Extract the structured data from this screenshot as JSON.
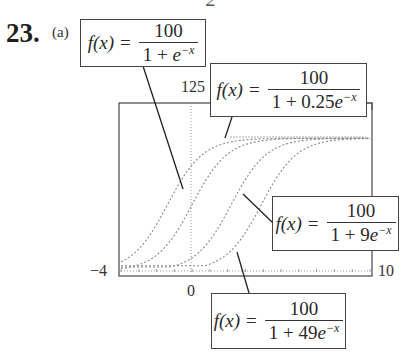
{
  "problem": {
    "number": "23.",
    "part": "(a)",
    "stray_glyph": "2"
  },
  "labels": [
    {
      "id": "f1",
      "fx": "f(x)",
      "eq": "=",
      "numerator": "100",
      "den_prefix": "1 + ",
      "den_e": "e",
      "den_exp": "−x"
    },
    {
      "id": "f2",
      "fx": "f(x)",
      "eq": "=",
      "numerator": "100",
      "den_prefix": "1 + 0.25",
      "den_e": "e",
      "den_exp": "−x"
    },
    {
      "id": "f3",
      "fx": "f(x)",
      "eq": "=",
      "numerator": "100",
      "den_prefix": "1 + 9",
      "den_e": "e",
      "den_exp": "−x"
    },
    {
      "id": "f4",
      "fx": "f(x)",
      "eq": "=",
      "numerator": "100",
      "den_prefix": "1 + 49",
      "den_e": "e",
      "den_exp": "−x"
    }
  ],
  "axes": {
    "ymax_label": "125",
    "xmin_label": "−4",
    "xmax_label": "10",
    "origin_label": "0"
  },
  "colors": {
    "curve": "#8a8a8a",
    "frame": "#555555",
    "text": "#222222"
  },
  "chart_data": {
    "type": "line",
    "title": "",
    "xlabel": "",
    "ylabel": "",
    "xlim": [
      -4,
      10
    ],
    "ylim": [
      0,
      125
    ],
    "tick_labels": {
      "x": [
        "−4",
        "0",
        "10"
      ],
      "y": [
        "125"
      ]
    },
    "grid": false,
    "legend": "callout boxes",
    "series": [
      {
        "name": "f(x) = 100/(1 + 0.25e^(−x))",
        "a": 0.25
      },
      {
        "name": "f(x) = 100/(1 + e^(−x))",
        "a": 1
      },
      {
        "name": "f(x) = 100/(1 + 9e^(−x))",
        "a": 9
      },
      {
        "name": "f(x) = 100/(1 + 49e^(−x))",
        "a": 49
      }
    ],
    "x": [
      -4,
      -3,
      -2,
      -1,
      0,
      1,
      2,
      3,
      4,
      5,
      6,
      7,
      8,
      9,
      10
    ],
    "values_by_series": {
      "a=0.25": [
        17.9,
        33.4,
        57.5,
        78.6,
        80.0,
        91.6,
        96.7,
        98.8,
        99.5,
        99.8,
        99.9,
        100,
        100,
        100,
        100
      ],
      "a=1": [
        1.8,
        4.7,
        11.9,
        26.9,
        50.0,
        73.1,
        88.1,
        95.3,
        98.2,
        99.3,
        99.8,
        99.9,
        100,
        100,
        100
      ],
      "a=9": [
        0.2,
        0.6,
        1.5,
        3.9,
        10.0,
        23.2,
        45.1,
        69.1,
        85.8,
        94.3,
        97.8,
        99.2,
        99.7,
        99.9,
        100
      ],
      "a=49": [
        0.04,
        0.1,
        0.3,
        0.7,
        2.0,
        5.3,
        13.1,
        29.1,
        52.7,
        75.2,
        89.2,
        95.7,
        98.4,
        99.4,
        99.8
      ]
    }
  }
}
